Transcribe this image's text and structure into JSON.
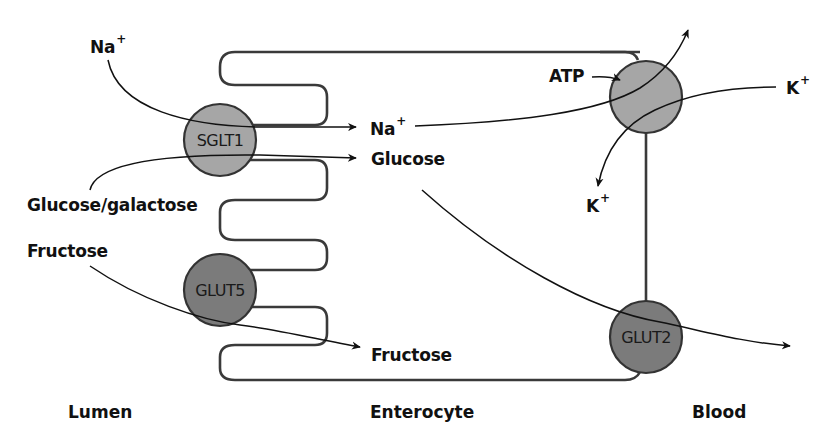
{
  "diagram": {
    "type": "intestinal monosaccharide absorption across enterocyte",
    "regions": {
      "lumen": "Lumen",
      "enterocyte": "Enterocyte",
      "blood": "Blood"
    },
    "transporters": [
      {
        "id": "sglt1",
        "label": "SGLT1",
        "fill": "#a6a6a6",
        "location": "apical membrane"
      },
      {
        "id": "glut5",
        "label": "GLUT5",
        "fill": "#7b7b7b",
        "location": "apical membrane"
      },
      {
        "id": "na_k_pump",
        "label": "",
        "fill": "#a6a6a6",
        "location": "basolateral membrane"
      },
      {
        "id": "glut2",
        "label": "GLUT2",
        "fill": "#7b7b7b",
        "location": "basolateral membrane"
      }
    ],
    "substrates": {
      "na_lumen": {
        "base": "Na",
        "charge": "+"
      },
      "na_cell": {
        "base": "Na",
        "charge": "+"
      },
      "k_blood": {
        "base": "K",
        "charge": "+"
      },
      "k_cell": {
        "base": "K",
        "charge": "+"
      },
      "glucose_galactose_lumen": "Glucose/galactose",
      "glucose_cell": "Glucose",
      "fructose_lumen": "Fructose",
      "fructose_cell": "Fructose",
      "atp": "ATP"
    },
    "flows": [
      {
        "from": "Na+ (lumen)",
        "via": "SGLT1",
        "to": "Na+ (enterocyte)"
      },
      {
        "from": "Glucose/galactose (lumen)",
        "via": "SGLT1",
        "to": "Glucose (enterocyte)"
      },
      {
        "from": "Fructose (lumen)",
        "via": "GLUT5",
        "to": "Fructose (enterocyte)"
      },
      {
        "from": "Na+ (enterocyte)",
        "via": "Na/K pump",
        "to": "Blood"
      },
      {
        "from": "K+ (blood)",
        "via": "Na/K pump",
        "to": "K+ (enterocyte)"
      },
      {
        "from": "ATP",
        "via": "Na/K pump",
        "to": ""
      },
      {
        "from": "Glucose (enterocyte)",
        "via": "GLUT2",
        "to": "Blood"
      }
    ],
    "colors": {
      "line": "#2a2a2a",
      "membrane": "#3a3a3a",
      "light_transporter": "#a6a6a6",
      "dark_transporter": "#7b7b7b",
      "background": "#ffffff"
    }
  }
}
